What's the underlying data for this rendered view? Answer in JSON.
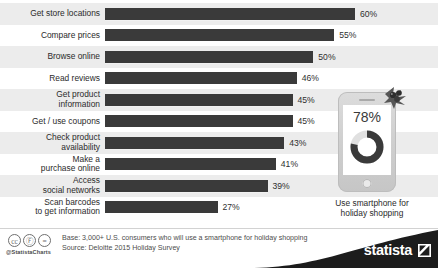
{
  "chart_data": {
    "type": "bar",
    "orientation": "horizontal",
    "title": "",
    "xlabel": "",
    "ylabel": "",
    "xlim": [
      0,
      65
    ],
    "grid": false,
    "legend": false,
    "value_suffix": "%",
    "categories": [
      "Get store locations",
      "Compare prices",
      "Browse online",
      "Read reviews",
      "Get product\ninformation",
      "Get / use coupons",
      "Check product\navailability",
      "Make a\npurchase online",
      "Access\nsocial networks",
      "Scan barcodes\nto get information"
    ],
    "values": [
      60,
      55,
      50,
      46,
      45,
      45,
      43,
      41,
      39,
      27
    ],
    "value_labels": [
      "60%",
      "55%",
      "50%",
      "46%",
      "45%",
      "45%",
      "43%",
      "41%",
      "39%",
      "27%"
    ],
    "bar_color": "#3a3a3a",
    "band_color": "#ececec"
  },
  "callout": {
    "percent_label": "78%",
    "donut_value": 78,
    "donut_color": "#3a3a3a",
    "donut_track_color": "#e3e3e3",
    "caption": "Use smartphone for\nholiday shopping",
    "phone_icon": "smartphone-icon",
    "decoration_icon": "holly-berries-icon"
  },
  "footer": {
    "license_icons": [
      "creative-commons-icon",
      "attribution-icon",
      "no-derivatives-icon"
    ],
    "license_glyphs": [
      "cc",
      "Ⓕ",
      "="
    ],
    "handle": "@StatistaCharts",
    "base_line": "Base: 3,000+ U.S. consumers who will use a smartphone for holiday shopping",
    "source_line": "Source: Deloitte 2015 Holiday Survey",
    "brand": "statista",
    "brand_bg": "#1c1c1c"
  }
}
